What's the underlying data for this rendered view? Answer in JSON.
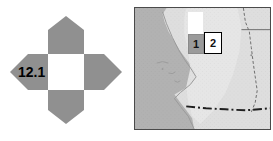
{
  "figure": {
    "id": "12.1",
    "pan_control": {
      "label": "12.1",
      "arrow_color": "#909090",
      "center_color": "#ffffff",
      "corner_color": "#808080",
      "directions": [
        {
          "name": "north",
          "label": ""
        },
        {
          "name": "east",
          "label": ""
        },
        {
          "name": "south",
          "label": ""
        },
        {
          "name": "west",
          "label": "12.1"
        }
      ]
    },
    "map": {
      "region_name": "California",
      "frame_color": "#4a4a4a",
      "ocean_color": "#b0b0b0",
      "land_color": "#dcdcdc",
      "inland_color": "#c9c9c9",
      "border_line_color": "#2b2b2b",
      "callouts": [
        {
          "name": "callout-tab",
          "label": "",
          "fill": "#ffffff"
        },
        {
          "name": "callout-1",
          "label": "1",
          "fill": "#9a9a9a"
        },
        {
          "name": "callout-2",
          "label": "2",
          "fill": "#ffffff"
        }
      ]
    }
  }
}
